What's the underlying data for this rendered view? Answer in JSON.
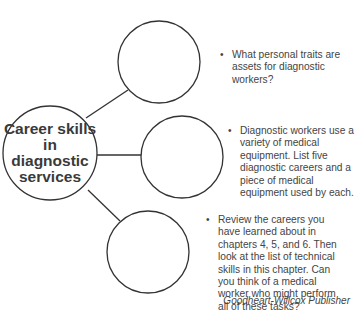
{
  "diagram": {
    "center_node": {
      "label": "Career skills in diagnostic services"
    },
    "branches": [
      {
        "id": "branch-1",
        "bullet": "•",
        "prompt": "What personal traits are assets for diagnostic workers?"
      },
      {
        "id": "branch-2",
        "bullet": "•",
        "prompt": "Diagnostic workers use a variety of medical equipment. List five diagnostic careers and a piece of medical equipment used by each."
      },
      {
        "id": "branch-3",
        "bullet": "•",
        "prompt": "Review the careers you have learned about in chapters 4, 5, and 6. Then look at the list of technical skills in this chapter. Can you think of a medical worker who might perform all of these tasks?"
      }
    ],
    "credit": "Goodheart-Willcox Publisher"
  },
  "colors": {
    "stroke": "#333333",
    "text": "#444444",
    "background": "#ffffff"
  }
}
